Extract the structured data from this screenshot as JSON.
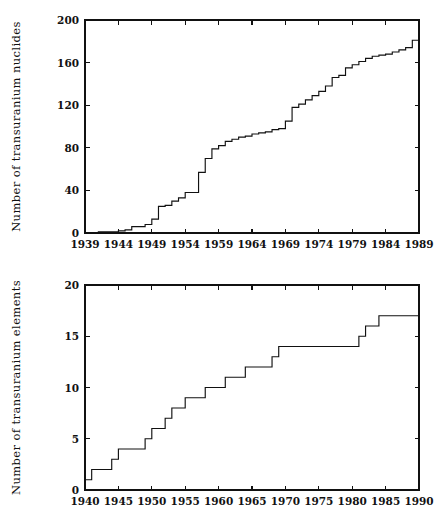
{
  "figure": {
    "background_color": "#ffffff",
    "ink_color": "#111111",
    "panel_count": 2
  },
  "chart_data": [
    {
      "id": "transuranium-nuclides",
      "type": "line",
      "step": "post",
      "title": "",
      "subtitle": "",
      "xlabel": "",
      "ylabel": "Number of transuranium nuclides",
      "xlim": [
        1939,
        1989
      ],
      "ylim": [
        0,
        200
      ],
      "xticks": [
        1939,
        1944,
        1949,
        1954,
        1959,
        1964,
        1969,
        1974,
        1979,
        1984,
        1989
      ],
      "xtick_labels": [
        "1939",
        "1944",
        "1949",
        "1954",
        "1959",
        "1964",
        "1969",
        "1974",
        "1979",
        "1984",
        "1989"
      ],
      "yticks": [
        0,
        40,
        80,
        120,
        160,
        200
      ],
      "ytick_labels": [
        "0",
        "40",
        "80",
        "120",
        "160",
        "200"
      ],
      "grid": false,
      "legend": null,
      "x": [
        1939,
        1940,
        1941,
        1942,
        1943,
        1944,
        1945,
        1946,
        1947,
        1948,
        1949,
        1950,
        1951,
        1952,
        1953,
        1954,
        1955,
        1956,
        1957,
        1958,
        1959,
        1960,
        1961,
        1962,
        1963,
        1964,
        1965,
        1966,
        1967,
        1968,
        1969,
        1970,
        1971,
        1972,
        1973,
        1974,
        1975,
        1976,
        1977,
        1978,
        1979,
        1980,
        1981,
        1982,
        1983,
        1984,
        1985,
        1986,
        1987,
        1988,
        1989
      ],
      "y": [
        0,
        0,
        1,
        1,
        1,
        2,
        3,
        6,
        6,
        8,
        13,
        25,
        26,
        30,
        33,
        38,
        38,
        57,
        70,
        79,
        82,
        86,
        88,
        90,
        91,
        93,
        94,
        95,
        97,
        98,
        105,
        118,
        121,
        125,
        129,
        133,
        138,
        146,
        148,
        155,
        158,
        161,
        164,
        166,
        167,
        168,
        170,
        172,
        174,
        181,
        181
      ],
      "notes": "Cumulative count of known transuranium nuclides per year; drawn as a right-continuous staircase."
    },
    {
      "id": "transuranium-elements",
      "type": "line",
      "step": "post",
      "title": "",
      "subtitle": "",
      "xlabel": "",
      "ylabel": "Number of transuranium elements",
      "xlim": [
        1940,
        1990
      ],
      "ylim": [
        0,
        20
      ],
      "xticks": [
        1940,
        1945,
        1950,
        1955,
        1960,
        1965,
        1970,
        1975,
        1980,
        1985,
        1990
      ],
      "xtick_labels": [
        "1940",
        "1945",
        "1950",
        "1955",
        "1960",
        "1965",
        "1970",
        "1975",
        "1980",
        "1985",
        "1990"
      ],
      "yticks": [
        0,
        5,
        10,
        15,
        20
      ],
      "ytick_labels": [
        "0",
        "5",
        "10",
        "15",
        "20"
      ],
      "grid": false,
      "legend": null,
      "x": [
        1940,
        1941,
        1944,
        1945,
        1949,
        1950,
        1952,
        1953,
        1955,
        1958,
        1961,
        1964,
        1968,
        1969,
        1974,
        1981,
        1982,
        1984,
        1990
      ],
      "y": [
        1,
        2,
        3,
        4,
        5,
        6,
        7,
        8,
        9,
        10,
        11,
        12,
        13,
        14,
        14,
        15,
        16,
        17,
        17
      ],
      "notes": "Cumulative count of discovered transuranium elements; right-continuous staircase from 1 element in 1940 to 17 by the mid-1980s."
    }
  ]
}
